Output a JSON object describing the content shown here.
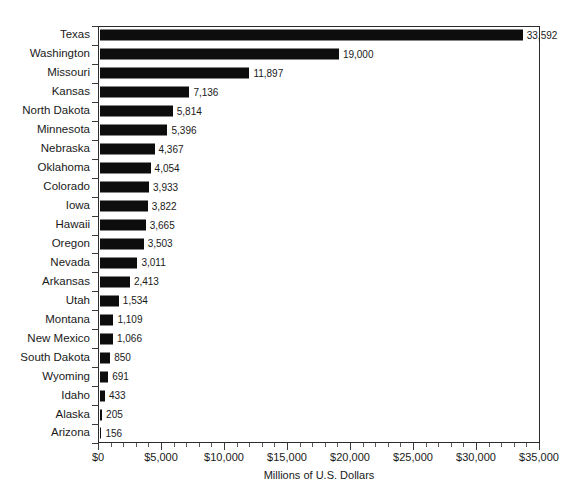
{
  "chart_data": {
    "type": "bar",
    "orientation": "horizontal",
    "title": "",
    "subtitle": "",
    "xlabel": "Millions of U.S. Dollars",
    "ylabel": "",
    "xlim": [
      0,
      35000
    ],
    "grid": false,
    "legend": null,
    "xticks": [
      {
        "value": 0,
        "label": "$0"
      },
      {
        "value": 5000,
        "label": "$5,000"
      },
      {
        "value": 10000,
        "label": "$10,000"
      },
      {
        "value": 15000,
        "label": "$15,000"
      },
      {
        "value": 20000,
        "label": "$20,000"
      },
      {
        "value": 25000,
        "label": "$25,000"
      },
      {
        "value": 30000,
        "label": "$30,000"
      },
      {
        "value": 35000,
        "label": "$35,000"
      }
    ],
    "minor_tick_interval": 1000,
    "bar_color": "#0d0d0d",
    "axis_color": "#2b2b2b",
    "categories": [
      "Texas",
      "Washington",
      "Missouri",
      "Kansas",
      "North Dakota",
      "Minnesota",
      "Nebraska",
      "Oklahoma",
      "Colorado",
      "Iowa",
      "Hawaii",
      "Oregon",
      "Nevada",
      "Arkansas",
      "Utah",
      "Montana",
      "New Mexico",
      "South Dakota",
      "Wyoming",
      "Idaho",
      "Alaska",
      "Arizona"
    ],
    "values": [
      33592,
      19000,
      11897,
      7136,
      5814,
      5396,
      4367,
      4054,
      3933,
      3822,
      3665,
      3503,
      3011,
      2413,
      1534,
      1109,
      1066,
      850,
      691,
      433,
      205,
      156
    ],
    "value_labels": [
      "33,592",
      "19,000",
      "11,897",
      "7,136",
      "5,814",
      "5,396",
      "4,367",
      "4,054",
      "3,933",
      "3,822",
      "3,665",
      "3,503",
      "3,011",
      "2,413",
      "1,534",
      "1,109",
      "1,066",
      "850",
      "691",
      "433",
      "205",
      "156"
    ]
  }
}
